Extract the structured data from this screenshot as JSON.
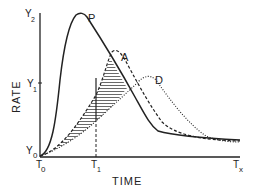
{
  "diagram": {
    "y_axis_label": "RATE",
    "x_axis_label": "TIME",
    "y_ticks": [
      {
        "label": "Y",
        "sub": "2"
      },
      {
        "label": "Y",
        "sub": "1"
      },
      {
        "label": "Y",
        "sub": "0"
      }
    ],
    "x_ticks": [
      {
        "label": "T",
        "sub": "0"
      },
      {
        "label": "T",
        "sub": "1"
      },
      {
        "label": "T",
        "sub": "x"
      }
    ],
    "curves": [
      {
        "name": "P",
        "style": "solid"
      },
      {
        "name": "A",
        "style": "dashed"
      },
      {
        "name": "D",
        "style": "dotted"
      }
    ],
    "shaded_region": "area between curves A and D, from T0 to intersection with P",
    "colors": {
      "ink": "#222222",
      "background": "#ffffff"
    }
  }
}
